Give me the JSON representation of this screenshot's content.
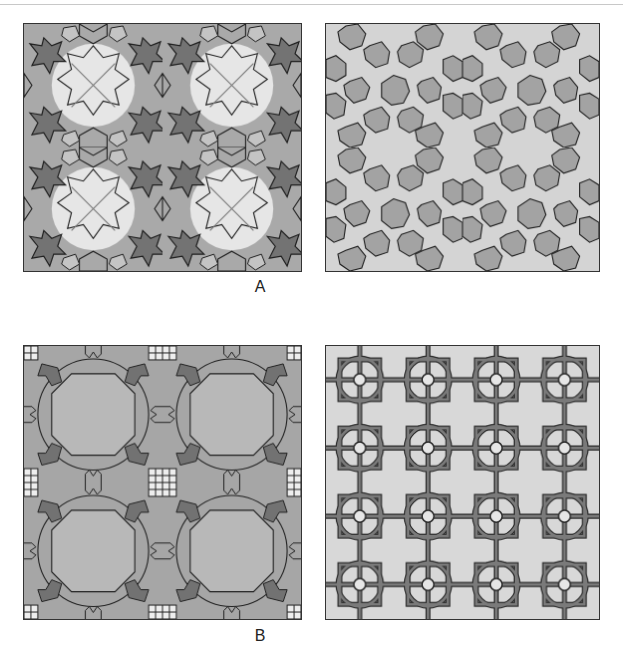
{
  "figure": {
    "panel_labels": {
      "a": "A",
      "b": "B"
    },
    "panels": [
      {
        "id": "A-left",
        "description": "Star-and-pentagon tessellation with light, mid and dark gray regions, 2x2 repeat"
      },
      {
        "id": "A-right",
        "description": "Heptagon / 7-point star tessellation, gray polygons on light background"
      },
      {
        "id": "B-left",
        "description": "Octagonal rosette pattern with curved strapwork, 2x2 repeat"
      },
      {
        "id": "B-right",
        "description": "Interlaced strapwork rendering of rosette pattern"
      }
    ],
    "colors": {
      "light": "#e6e6e6",
      "mid": "#a9a9a9",
      "dark": "#737373",
      "line": "#1e1e1e",
      "strap": "#6a6a6a"
    }
  }
}
